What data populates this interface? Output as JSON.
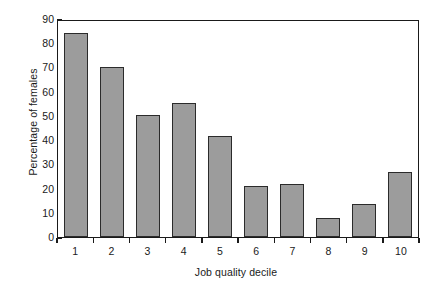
{
  "chart_data": {
    "type": "bar",
    "title": "",
    "xlabel": "Job quality decile",
    "ylabel": "Percentage of females",
    "categories": [
      "1",
      "2",
      "3",
      "4",
      "5",
      "6",
      "7",
      "8",
      "9",
      "10"
    ],
    "values": [
      84.3,
      70.3,
      50.4,
      55.3,
      41.5,
      20.9,
      21.9,
      8.0,
      13.6,
      26.8
    ],
    "ylim": [
      0,
      90
    ],
    "yticks": [
      0,
      10,
      20,
      30,
      40,
      50,
      60,
      70,
      80,
      90
    ],
    "ytick_labels": [
      "0",
      "10",
      "20",
      "30",
      "40",
      "50",
      "60",
      "70",
      "80",
      "90"
    ],
    "grid": false,
    "legend": false,
    "bar_fill_color": "#9c9c9c",
    "bar_edge_color": "#2b2b2b",
    "axis_color": "#1a1a1a",
    "background_color": "#ffffff"
  }
}
